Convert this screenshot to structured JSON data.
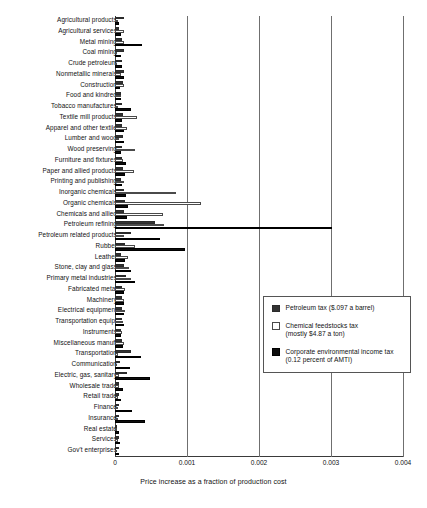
{
  "chart_data": {
    "type": "bar",
    "orientation": "horizontal",
    "title": "",
    "xlabel": "Price increase as a fraction of production cost",
    "ylabel": "",
    "xlim": [
      0,
      0.004
    ],
    "xticks": [
      "0",
      "0.001",
      "0.002",
      "0.003",
      "0.004"
    ],
    "xtick_values": [
      0,
      0.001,
      0.002,
      0.003,
      0.004
    ],
    "grid": "vertical gridlines at 0.001, 0.002, 0.003, 0.004",
    "legend_position": "center-right inside axes",
    "series": [
      {
        "name": "Petroleum tax ($.097 a barrel)",
        "color": "#333333",
        "values": [
          0.00012,
          6e-05,
          0.0001,
          0.00013,
          0.0001,
          0.00012,
          0.00011,
          9e-05,
          0.0001,
          0.00011,
          0.0001,
          0.00011,
          0.0001,
          0.0001,
          0.00011,
          9e-05,
          0.00013,
          0.00014,
          0.00013,
          0.00055,
          0.00022,
          0.00014,
          9e-05,
          0.00013,
          0.00015,
          0.0001,
          0.0001,
          0.0001,
          0.0001,
          9e-05,
          0.0001,
          0.00022,
          7e-05,
          0.00017,
          6e-05,
          5e-05,
          6e-05,
          6e-05,
          3e-05,
          5e-05,
          5e-05
        ]
      },
      {
        "name": "Chemical feedstocks tax (mostly $4.87 a ton)",
        "color": "#ffffff",
        "values": [
          4e-05,
          0.00013,
          0.00013,
          3e-05,
          2e-05,
          9e-05,
          0.00012,
          8e-05,
          4e-05,
          0.00031,
          0.00016,
          6e-05,
          0.00028,
          0.00011,
          0.00026,
          0.00012,
          0.00085,
          0.0012,
          0.00067,
          0.00068,
          0.00012,
          0.00028,
          0.00018,
          0.00019,
          0.00022,
          0.00014,
          0.00012,
          0.00014,
          0.00011,
          0.0001,
          0.00012,
          4e-05,
          3e-05,
          6e-05,
          5e-05,
          4e-05,
          4e-05,
          4e-05,
          2e-05,
          4e-05,
          3e-05
        ]
      },
      {
        "name": "Corporate environmental income tax (0.12 percent of AMTI)",
        "color": "#0d0d0d",
        "values": [
          5e-05,
          8e-05,
          0.00038,
          9e-05,
          0.0001,
          0.00012,
          7e-05,
          8e-05,
          0.00022,
          0.0001,
          0.00012,
          0.00013,
          8e-05,
          0.00015,
          0.00014,
          0.0001,
          0.00015,
          0.00018,
          0.00016,
          0.00302,
          0.00062,
          0.00097,
          0.00014,
          0.00022,
          0.00028,
          0.00013,
          0.00012,
          0.00013,
          0.00012,
          9e-05,
          0.00011,
          0.00036,
          0.00021,
          0.00048,
          0.00011,
          8e-05,
          0.00024,
          0.00041,
          5e-05,
          7e-05,
          6e-05
        ]
      }
    ],
    "categories": [
      "Agricultural products",
      "Agricultural services",
      "Metal mining",
      "Coal mining",
      "Crude petroleum",
      "Nonmetallic minerals",
      "Construction",
      "Food and kindred",
      "Tobacco manufactures",
      "Textile mill products",
      "Apparel and other textile",
      "Lumber and wood",
      "Wood preserving",
      "Furniture and fixtures",
      "Paper and allied products",
      "Printing and publishing",
      "Inorganic chemicals",
      "Organic chemicals",
      "Chemicals and allied",
      "Petroleum refining",
      "Petroleum related products",
      "Rubber",
      "Leather",
      "Stone, clay and glass",
      "Primary metal industries",
      "Fabricated metal",
      "Machinery",
      "Electrical equipment",
      "Transportation equip.",
      "Instruments",
      "Miscellaneous manuf.",
      "Transportation",
      "Communication",
      "Electric, gas, sanitary",
      "Wholesale trade",
      "Retail trade",
      "Finance",
      "Insurance",
      "Real estate",
      "Services",
      "Gov't enterprises"
    ]
  },
  "legend": {
    "entries": [
      {
        "label": "Petroleum tax ($.097 a barrel)",
        "label2": "",
        "swatch": "petroleum"
      },
      {
        "label": "Chemical feedstocks tax",
        "label2": "(mostly $4.87 a ton)",
        "swatch": "feedstock"
      },
      {
        "label": "Corporate environmental income tax",
        "label2": "(0.12 percent of AMTI)",
        "swatch": "corporate"
      }
    ]
  }
}
